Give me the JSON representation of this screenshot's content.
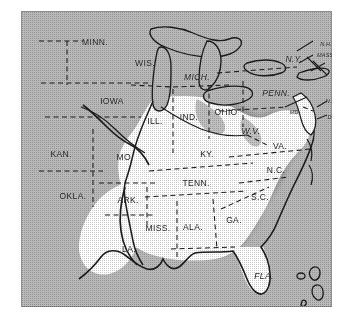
{
  "figure": {
    "kind": "printed-halftone-map",
    "region_title": "Eastern and Central United States",
    "background_color": "#ffffff",
    "screen_gray": "#b9b9b9",
    "highlight_fill": "#ffffff",
    "soft_shadow": "#cfcfcf",
    "ink_color": "#1d1d1d",
    "frame": {
      "x": 21,
      "y": 11,
      "width": 311,
      "height": 296
    }
  },
  "legend_note": "",
  "highlighted_states": [
    "ILL.",
    "IND.",
    "OHIO",
    "KY.",
    "TENN.",
    "MISS.",
    "ALA.",
    "GA.",
    "FLA.",
    "S.C.",
    "N.C.",
    "VA.",
    "W.V.",
    "ARK.",
    "LA.",
    "MO."
  ],
  "shaded_states": [
    "MINN.",
    "WIS.",
    "MICH.",
    "IOWA",
    "KAN.",
    "OKLA.",
    "N.Y.",
    "PENN.",
    "N.H.",
    "MASS.",
    "N.J.",
    "DEL.",
    "MD."
  ],
  "labels": [
    {
      "id": "minn",
      "text": "MINN.",
      "x": 74,
      "y": 31,
      "size": "normal",
      "slant": false
    },
    {
      "id": "wis",
      "text": "WIS.",
      "x": 124,
      "y": 52,
      "size": "normal",
      "slant": false
    },
    {
      "id": "mich",
      "text": "MICH.",
      "x": 176,
      "y": 66,
      "size": "normal",
      "slant": true
    },
    {
      "id": "iowa",
      "text": "IOWA",
      "x": 91,
      "y": 90,
      "size": "normal",
      "slant": false
    },
    {
      "id": "ill",
      "text": "ILL.",
      "x": 134,
      "y": 110,
      "size": "normal",
      "slant": false
    },
    {
      "id": "ind",
      "text": "IND.",
      "x": 168,
      "y": 106,
      "size": "normal",
      "slant": false
    },
    {
      "id": "ohio",
      "text": "OHIO",
      "x": 205,
      "y": 101,
      "size": "normal",
      "slant": false
    },
    {
      "id": "penn",
      "text": "PENN.",
      "x": 255,
      "y": 82,
      "size": "normal",
      "slant": true
    },
    {
      "id": "ny",
      "text": "N.Y.",
      "x": 273,
      "y": 48,
      "size": "normal",
      "slant": true
    },
    {
      "id": "nh",
      "text": "N.H.",
      "x": 305,
      "y": 33,
      "size": "tiny",
      "slant": true
    },
    {
      "id": "mass",
      "text": "MASS.",
      "x": 305,
      "y": 44,
      "size": "tiny",
      "slant": true
    },
    {
      "id": "nj",
      "text": "N.J.",
      "x": 310,
      "y": 90,
      "size": "tiny",
      "slant": true
    },
    {
      "id": "del",
      "text": "DEL.",
      "x": 313,
      "y": 106,
      "size": "tiny",
      "slant": true
    },
    {
      "id": "md",
      "text": "MD.",
      "x": 274,
      "y": 101,
      "size": "tiny",
      "slant": true
    },
    {
      "id": "wva",
      "text": "W.V.",
      "x": 230,
      "y": 120,
      "size": "normal",
      "slant": true
    },
    {
      "id": "va",
      "text": "VA.",
      "x": 259,
      "y": 135,
      "size": "normal",
      "slant": false
    },
    {
      "id": "kan",
      "text": "KAN.",
      "x": 40,
      "y": 143,
      "size": "normal",
      "slant": false
    },
    {
      "id": "mo",
      "text": "MO.",
      "x": 104,
      "y": 146,
      "size": "normal",
      "slant": false
    },
    {
      "id": "ky",
      "text": "KY.",
      "x": 186,
      "y": 143,
      "size": "normal",
      "slant": false
    },
    {
      "id": "nc",
      "text": "N.C.",
      "x": 255,
      "y": 159,
      "size": "normal",
      "slant": false
    },
    {
      "id": "okla",
      "text": "OKLA.",
      "x": 52,
      "y": 185,
      "size": "normal",
      "slant": false
    },
    {
      "id": "ark",
      "text": "ARK.",
      "x": 107,
      "y": 189,
      "size": "normal",
      "slant": false
    },
    {
      "id": "tenn",
      "text": "TENN.",
      "x": 175,
      "y": 172,
      "size": "normal",
      "slant": false
    },
    {
      "id": "sc",
      "text": "S.C.",
      "x": 239,
      "y": 186,
      "size": "normal",
      "slant": false
    },
    {
      "id": "ga",
      "text": "GA.",
      "x": 213,
      "y": 209,
      "size": "normal",
      "slant": false
    },
    {
      "id": "ala",
      "text": "ALA.",
      "x": 172,
      "y": 216,
      "size": "normal",
      "slant": false
    },
    {
      "id": "miss",
      "text": "MISS.",
      "x": 137,
      "y": 217,
      "size": "normal",
      "slant": false
    },
    {
      "id": "la",
      "text": "LA.",
      "x": 108,
      "y": 238,
      "size": "normal",
      "slant": false
    },
    {
      "id": "fla",
      "text": "FLA.",
      "x": 243,
      "y": 265,
      "size": "normal",
      "slant": true
    }
  ]
}
